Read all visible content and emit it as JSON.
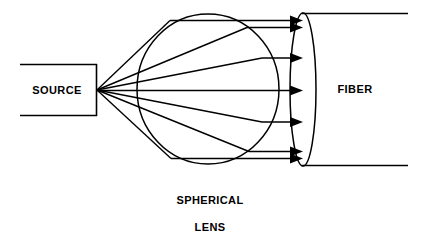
{
  "figure": {
    "title_visible": false,
    "background_color": "#ffffff",
    "line_color": "#000000",
    "width": 424,
    "height": 247
  },
  "labels": {
    "source": "SOURCE",
    "fiber": "FIBER",
    "lens_line1": "SPHERICAL",
    "lens_line2": "LENS"
  },
  "diagram_data": {
    "type": "optical-ray-diagram",
    "description": "Light from a source is collected by a spherical lens and coupled into an optical fiber",
    "components": [
      {
        "name": "source",
        "label": "SOURCE",
        "shape": "open-rectangle",
        "open_side": "left",
        "x": 20,
        "y": 64,
        "width": 77,
        "height": 52,
        "emission_point": {
          "x": 97,
          "y": 90
        }
      },
      {
        "name": "spherical-lens",
        "label": "SPHERICAL LENS",
        "shape": "ellipse",
        "cx": 208,
        "cy": 89,
        "rx": 71,
        "ry": 75
      },
      {
        "name": "fiber",
        "label": "FIBER",
        "shape": "cylinder-end-ellipse",
        "face_cx": 303,
        "face_cy": 89,
        "face_rx": 13,
        "face_ry": 77,
        "body_right_x": 408,
        "top_wall_y": 13,
        "bottom_wall_y": 166
      }
    ],
    "rays": {
      "count": 7,
      "origin": {
        "x": 97,
        "y": 90
      },
      "exit_y_values": [
        20,
        27,
        58,
        91,
        122,
        152,
        158
      ],
      "lens_exit_x": 262,
      "arrow_tip_x": 303,
      "note": "Divergent rays from source are refracted by the lens into parallel rays that enter the fiber end-face"
    }
  },
  "text_positions": {
    "source": {
      "x": 57,
      "y": 91
    },
    "fiber": {
      "x": 355,
      "y": 90
    },
    "lens_line1": {
      "x": 210,
      "y": 201
    },
    "lens_line2": {
      "x": 210,
      "y": 228
    }
  }
}
